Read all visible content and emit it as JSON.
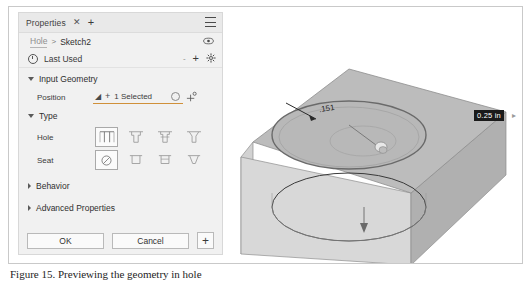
{
  "panel": {
    "titlebar": {
      "tab_label": "Properties",
      "close_icon": "close-icon",
      "add_tab_icon": "plus-icon",
      "menu_icon": "hamburger-menu-icon"
    },
    "breadcrumb": {
      "parent": "Hole",
      "separator": ">",
      "current": "Sketch2",
      "visibility_icon": "eye-icon"
    },
    "preset_row": {
      "icon": "clock-history-icon",
      "label": "Last Used",
      "dash": "-",
      "add_icon": "plus-icon",
      "settings_icon": "gear-icon"
    },
    "sections": [
      {
        "label": "Input Geometry",
        "expanded": true
      },
      {
        "label": "Type",
        "expanded": true
      },
      {
        "label": "Behavior",
        "expanded": false
      },
      {
        "label": "Advanced Properties",
        "expanded": false
      }
    ],
    "input_geometry": {
      "position": {
        "label": "Position",
        "cursor_icon": "select-cursor-icon",
        "add_icon": "plus-icon",
        "value": "1 Selected",
        "clear_icon": "clear-selection-icon",
        "axis_icon": "axis-reference-icon"
      }
    },
    "type": {
      "hole": {
        "label": "Hole",
        "options": [
          {
            "name": "simple-hole-icon",
            "selected": true
          },
          {
            "name": "counterbore-hole-icon",
            "selected": false
          },
          {
            "name": "spotface-hole-icon",
            "selected": false
          },
          {
            "name": "countersink-hole-icon",
            "selected": false
          }
        ]
      },
      "seat": {
        "label": "Seat",
        "options": [
          {
            "name": "no-seat-icon",
            "selected": true
          },
          {
            "name": "counterbore-seat-icon",
            "selected": false
          },
          {
            "name": "spotface-seat-icon",
            "selected": false
          },
          {
            "name": "countersink-seat-icon",
            "selected": false
          }
        ]
      }
    },
    "buttons": {
      "ok": "OK",
      "cancel": "Cancel",
      "add": "+"
    }
  },
  "viewport": {
    "dimension_callout": "0.25 in",
    "expand_arrow_icon": "chevron-right-icon",
    "hole_annotation": ".151",
    "model_name": "block-with-hole-3d-model"
  },
  "caption": {
    "text": "Figure 15. Previewing the geometry in hole"
  },
  "colors": {
    "panel_bg": "#f1f1f1",
    "titlebar_bg": "#e9e9e9",
    "accent_underline": "#d0903a",
    "callout_bg": "#1a1a1a",
    "model_top": "#b5b5b5",
    "model_front": "#d6d6d6",
    "model_side": "#a8a8a8"
  }
}
